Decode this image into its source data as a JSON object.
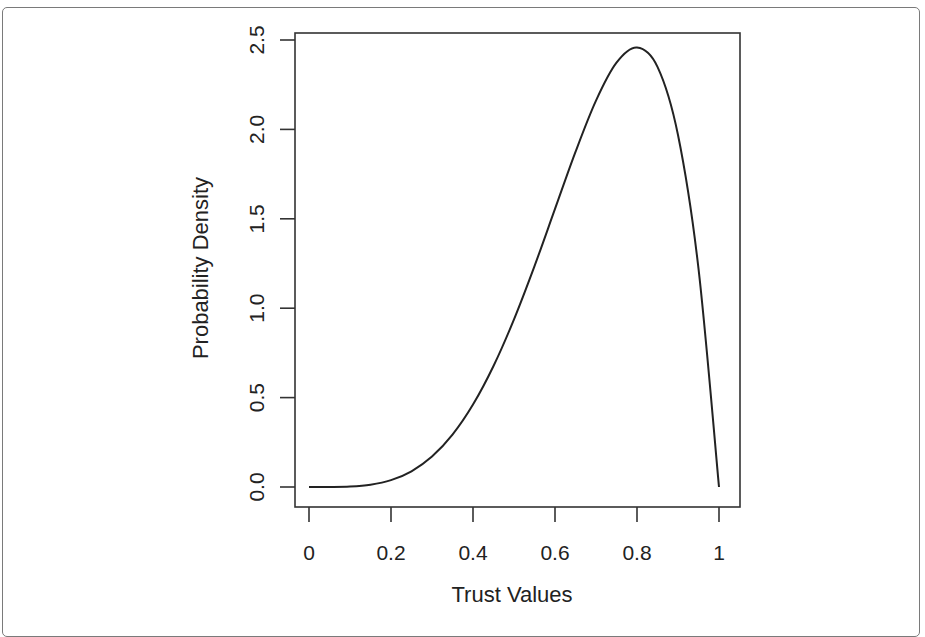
{
  "chart_data": {
    "type": "line",
    "title": "",
    "xlabel": "Trust Values",
    "ylabel": "Probability Density",
    "xlim": [
      0,
      1
    ],
    "ylim": [
      0,
      2.5
    ],
    "grid": false,
    "legend": "none",
    "x_ticks": [
      0,
      0.2,
      0.4,
      0.6,
      0.8,
      1
    ],
    "x_tick_labels": [
      "0",
      "0.2",
      "0.4",
      "0.6",
      "0.8",
      "1"
    ],
    "y_ticks": [
      0,
      0.5,
      1.0,
      1.5,
      2.0,
      2.5
    ],
    "y_tick_labels": [
      "0.0",
      "0.5",
      "1.0",
      "1.5",
      "2.0",
      "2.5"
    ],
    "series": [
      {
        "name": "Beta(5,2) density",
        "color": "#222222",
        "x": [
          0,
          0.05,
          0.1,
          0.15,
          0.2,
          0.25,
          0.3,
          0.35,
          0.4,
          0.45,
          0.5,
          0.55,
          0.6,
          0.65,
          0.7,
          0.75,
          0.8,
          0.85,
          0.9,
          0.95,
          1.0
        ],
        "y": [
          0,
          0.0002,
          0.0027,
          0.0129,
          0.0384,
          0.0879,
          0.1701,
          0.2926,
          0.4608,
          0.6765,
          0.9375,
          1.2353,
          1.5552,
          1.8743,
          2.1609,
          2.373,
          2.4576,
          2.3494,
          1.9683,
          1.2217,
          0
        ]
      }
    ]
  }
}
